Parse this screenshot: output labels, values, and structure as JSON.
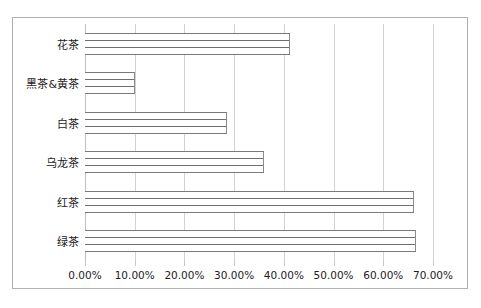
{
  "page": {
    "top_text_fragment": "— —— — —— —— — —— — ——— — —— —"
  },
  "colors": {
    "frame_border": "#b0b0b0",
    "gridline": "#d2d2d2",
    "bar_outline": "#7a7a7a",
    "bar_fill": "#ffffff",
    "text": "#1c1c1c",
    "background": "#ffffff"
  },
  "chart_data": {
    "type": "bar",
    "orientation": "horizontal",
    "title": "",
    "xlabel": "",
    "ylabel": "",
    "categories": [
      "绿茶",
      "红茶",
      "乌龙茶",
      "白茶",
      "黑茶&黄茶",
      "花茶"
    ],
    "values": [
      66.5,
      66.2,
      36.0,
      28.5,
      10.0,
      41.2
    ],
    "value_suffix": "%",
    "xlim": [
      0,
      70
    ],
    "xticks": [
      0,
      10,
      20,
      30,
      40,
      50,
      60,
      70
    ],
    "xticklabels": [
      "0.00%",
      "10.00%",
      "20.00%",
      "30.00%",
      "40.00%",
      "50.00%",
      "60.00%",
      "70.00%"
    ],
    "grid": true,
    "grid_axis": "x",
    "legend": false,
    "legend_position": "none",
    "bar_style": "hollow-horizontal-hatch",
    "category_order_top_to_bottom": [
      "花茶",
      "黑茶&黄茶",
      "白茶",
      "乌龙茶",
      "红茶",
      "绿茶"
    ]
  }
}
